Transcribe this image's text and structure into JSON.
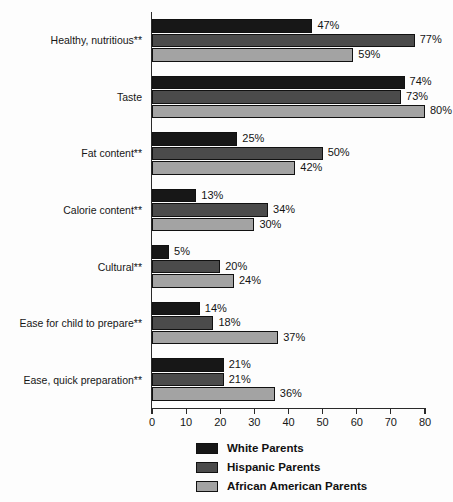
{
  "chart_data": {
    "type": "bar",
    "orientation": "horizontal",
    "title": "",
    "subtitle": "",
    "xlabel": "",
    "ylabel": "",
    "xlim": [
      0,
      80
    ],
    "xticks": [
      0,
      10,
      20,
      30,
      40,
      50,
      60,
      70,
      80
    ],
    "xtick_labels": [
      "0",
      "10",
      "20",
      "30",
      "40",
      "50",
      "60",
      "70",
      "80"
    ],
    "grid": false,
    "legend_position": "bottom-center",
    "value_label_suffix": "%",
    "categories": [
      "Healthy, nutritious**",
      "Taste",
      "Fat content**",
      "Calorie content**",
      "Cultural**",
      "Ease for child to prepare**",
      "Ease, quick preparation**"
    ],
    "series": [
      {
        "name": "White Parents",
        "color": "#171717",
        "values": [
          47,
          74,
          25,
          13,
          5,
          14,
          21
        ],
        "value_labels": [
          "47%",
          "74%",
          "25%",
          "13%",
          "5%",
          "14%",
          "21%"
        ]
      },
      {
        "name": "Hispanic Parents",
        "color": "#4b4b4b",
        "values": [
          77,
          73,
          50,
          34,
          20,
          18,
          21
        ],
        "value_labels": [
          "77%",
          "73%",
          "50%",
          "34%",
          "20%",
          "18%",
          "21%"
        ]
      },
      {
        "name": "African American Parents",
        "color": "#a3a3a3",
        "values": [
          59,
          80,
          42,
          30,
          24,
          37,
          36
        ],
        "value_labels": [
          "59%",
          "80%",
          "42%",
          "30%",
          "24%",
          "37%",
          "36%"
        ]
      }
    ]
  },
  "legend": {
    "entries": [
      {
        "label": "White Parents",
        "color": "#171717"
      },
      {
        "label": "Hispanic Parents",
        "color": "#4b4b4b"
      },
      {
        "label": "African American Parents",
        "color": "#a3a3a3"
      }
    ]
  }
}
